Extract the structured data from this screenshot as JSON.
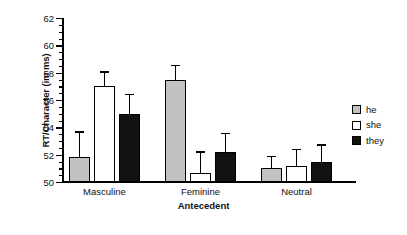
{
  "chart_data": {
    "type": "bar",
    "title": "",
    "xlabel": "Antecedent",
    "ylabel": "RT/Character (im ms)",
    "categories": [
      "Masculine",
      "Feminine",
      "Neutral"
    ],
    "ylim": [
      50,
      62
    ],
    "yticks": [
      50,
      52,
      54,
      56,
      58,
      60,
      62
    ],
    "ytick_labels": [
      "50",
      "52",
      "54",
      "56",
      "58",
      "60",
      "62"
    ],
    "minor_tick_step": 0.5,
    "grid": false,
    "legend_position": "right",
    "series": [
      {
        "name": "he",
        "color": "#c2c2c2",
        "values": [
          51.8,
          57.45,
          51.0
        ],
        "errors": [
          1.9,
          1.1,
          0.9
        ]
      },
      {
        "name": "she",
        "color": "#ffffff",
        "values": [
          57.0,
          50.65,
          51.2
        ],
        "errors": [
          1.1,
          1.6,
          1.2
        ]
      },
      {
        "name": "they",
        "color": "#111111",
        "values": [
          54.95,
          52.2,
          51.45
        ],
        "errors": [
          1.5,
          1.4,
          1.3
        ]
      }
    ]
  },
  "legend": {
    "entries": [
      {
        "label": "he",
        "swatch": "gray-swatch"
      },
      {
        "label": "she",
        "swatch": "white-swatch"
      },
      {
        "label": "they",
        "swatch": "black-swatch"
      }
    ]
  }
}
